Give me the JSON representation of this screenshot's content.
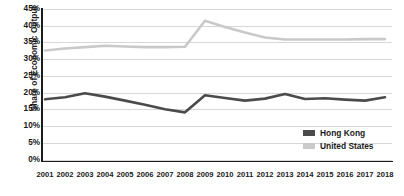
{
  "chart_data": {
    "type": "line",
    "title": "",
    "xlabel": "",
    "ylabel": "Share of Economic Output",
    "x": [
      2001,
      2002,
      2003,
      2004,
      2005,
      2006,
      2007,
      2008,
      2009,
      2010,
      2011,
      2012,
      2013,
      2014,
      2015,
      2016,
      2017,
      2018
    ],
    "xtick_labels": [
      "2001",
      "2002",
      "2003",
      "2004",
      "2005",
      "2006",
      "2007",
      "2008",
      "2009",
      "2010",
      "2011",
      "2012",
      "2013",
      "2014",
      "2015",
      "2016",
      "2017",
      "2018"
    ],
    "ytick_labels": [
      "45%",
      "40%",
      "35%",
      "30%",
      "25%",
      "20%",
      "15%",
      "10%",
      "5%",
      "0%"
    ],
    "ytick_values": [
      45,
      40,
      35,
      30,
      25,
      20,
      15,
      10,
      5,
      0
    ],
    "ylim": [
      0,
      45
    ],
    "ytick_suffix": "%",
    "grid": "horizontal",
    "legend_position": "inside-bottom-right",
    "series": [
      {
        "name": "Hong Kong",
        "color": "#4b4b4b",
        "values": [
          18.0,
          18.6,
          19.8,
          18.8,
          17.6,
          16.4,
          15.0,
          14.1,
          19.2,
          18.4,
          17.6,
          18.2,
          19.6,
          18.1,
          18.3,
          17.9,
          17.6,
          18.6
        ]
      },
      {
        "name": "United States",
        "color": "#c9c9c9",
        "values": [
          32.6,
          33.2,
          33.6,
          34.0,
          33.8,
          33.6,
          33.6,
          33.7,
          41.5,
          39.6,
          38.0,
          36.5,
          35.9,
          35.9,
          35.9,
          35.9,
          36.0,
          36.0
        ]
      }
    ],
    "legend": [
      {
        "label": "Hong Kong",
        "color": "#4b4b4b"
      },
      {
        "label": "United States",
        "color": "#c9c9c9"
      }
    ]
  }
}
